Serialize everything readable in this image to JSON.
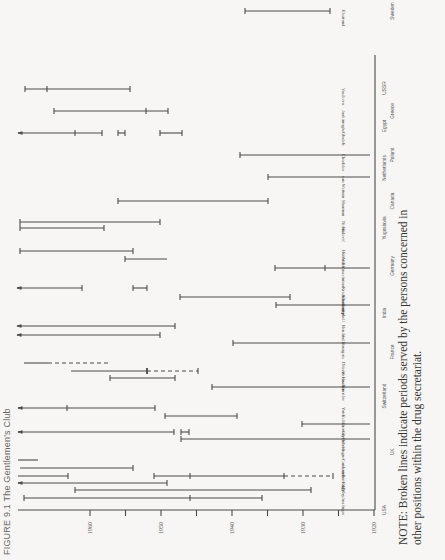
{
  "figure": {
    "title": "FIGURE 9.1   The Gentlemen's Club",
    "note_line1": "NOTE: Broken lines indicate periods served by the persons concerned in",
    "note_line2": "other positions within the drug secretariat."
  },
  "colors": {
    "ink": "#4a4a4a",
    "background": "#f7f6f4"
  },
  "chart_data": {
    "type": "timeline",
    "title": "The Gentlemen's Club",
    "xlabel": "Year",
    "axis_ticks": [
      1920,
      1930,
      1940,
      1950,
      1960
    ],
    "xlim": [
      1920,
      1968
    ],
    "legend_note": "Broken lines indicate periods served by the persons concerned in other positions within the drug secretariat.",
    "countries": [
      "USA",
      "UK",
      "Switzerland",
      "France",
      "India",
      "Germany",
      "Yugoslavia",
      "Canada",
      "Netherlands",
      "Poland",
      "Egypt",
      "Greece",
      "USSR",
      "Sweden"
    ],
    "persons": [
      {
        "name": "Anslinger",
        "country": "USA",
        "segments": [
          [
            1930,
            1962
          ]
        ],
        "marks": [
          1946
        ]
      },
      {
        "name": "May",
        "country": "USA",
        "segments": [
          [
            1927,
            1957
          ]
        ]
      },
      {
        "name": "Eddy",
        "country": "USA",
        "segments": [
          [
            1952,
            1967
          ]
        ]
      },
      {
        "name": "Sniving",
        "country": "USA",
        "segments": [
          [
            1946,
            1958
          ],
          [
            1931,
            1946
          ],
          [
            1920,
            1931,
            "dashed"
          ]
        ],
        "marks": [
          1933,
          1946
        ]
      },
      {
        "name": "Lande",
        "country": "USA",
        "segments": [
          [
            1953,
            1967
          ]
        ]
      },
      {
        "name": "Cameron",
        "country": "USA",
        "segments": [
          [
            1964,
            1967
          ]
        ]
      },
      {
        "name": "Delevingne",
        "country": "UK",
        "segments": [
          [
            1913,
            1946
          ]
        ]
      },
      {
        "name": "Greenfield",
        "country": "UK",
        "segments": [
          [
            1947,
            1948
          ]
        ]
      },
      {
        "name": "Crowdy",
        "country": "UK",
        "segments": [
          [
            1922,
            1931
          ]
        ]
      },
      {
        "name": "Felkin",
        "country": "UK",
        "segments": [
          [
            1937,
            1947
          ]
        ]
      },
      {
        "name": "Yates",
        "country": "UK",
        "segments": [
          [
            1949,
            1966
          ]
        ],
        "marks": [
          1962
        ]
      },
      {
        "name": "Carrière",
        "country": "Switzerland",
        "segments": [
          [
            1928,
            1944
          ]
        ]
      },
      {
        "name": "Fischer",
        "country": "Switzerland",
        "segments": [
          [
            1948,
            1957
          ]
        ]
      },
      {
        "name": "Atzenwiler",
        "country": "Switzerland",
        "segments": [
          [
            1945,
            1956
          ],
          [
            1941,
            1945,
            "dashed"
          ]
        ]
      },
      {
        "name": "Ditzert",
        "country": "Switzerland",
        "segments": [
          [
            1961,
            1965
          ],
          [
            1953,
            1961,
            "dashed"
          ]
        ]
      },
      {
        "name": "Bourgois",
        "country": "France",
        "segments": [
          [
            1920,
            1938
          ]
        ]
      },
      {
        "name": "Vaille",
        "country": "France",
        "segments": [
          [
            1947,
            1968
          ]
        ]
      },
      {
        "name": "Renier",
        "country": "France",
        "segments": [
          [
            1945,
            1968
          ]
        ]
      },
      {
        "name": "Campbell",
        "country": "India",
        "segments": [
          [
            1920,
            1935
          ]
        ]
      },
      {
        "name": "Chatterjee",
        "country": "India",
        "segments": [
          [
            1935,
            1949
          ]
        ]
      },
      {
        "name": "Krishnamoorty",
        "country": "India",
        "segments": [
          [
            1952,
            1954
          ]
        ]
      },
      {
        "name": "Anselmino",
        "country": "Germany",
        "segments": [
          [
            1920,
            1935
          ]
        ],
        "marks": [
          1928
        ]
      },
      {
        "name": "Wolff",
        "country": "Germany",
        "segments": [
          [
            1951,
            1955
          ]
        ]
      },
      {
        "name": "Hüttisch",
        "country": "Germany",
        "segments": [
          [
            1952,
            1968
          ]
        ]
      },
      {
        "name": "Nicolić",
        "country": "Yugoslavia",
        "segments": [
          [
            1953,
            1967
          ],
          [
            1953,
            1967
          ]
        ]
      },
      {
        "name": "Kušević",
        "country": "Yugoslavia",
        "segments": [
          [
            1949,
            1951
          ],
          [
            1956,
            1967
          ]
        ]
      },
      {
        "name": "Sharman",
        "country": "Canada",
        "segments": [
          [
            1925,
            1946
          ]
        ]
      },
      {
        "name": "van Wettum",
        "country": "Netherlands",
        "segments": [
          [
            1920,
            1933
          ]
        ]
      },
      {
        "name": "Chodzko",
        "country": "Poland",
        "segments": [
          [
            1920,
            1937
          ]
        ]
      },
      {
        "name": "Ghaleb",
        "country": "Egypt",
        "segments": [
          [
            1948,
            1951
          ],
          [
            1954,
            1955
          ],
          [
            1958,
            1962
          ],
          [
            1962,
            1968
          ]
        ]
      },
      {
        "name": "Joakimoglu",
        "country": "Greece",
        "segments": [
          [
            1948,
            1957
          ]
        ]
      },
      {
        "name": "Vasilieva",
        "country": "USSR",
        "segments": [
          [
            1955,
            1965
          ]
        ],
        "marks": [
          1963
        ]
      },
      {
        "name": "Ekstrand",
        "country": "Sweden",
        "segments": [
          [
            1931,
            1937
          ]
        ]
      }
    ]
  },
  "axis": {
    "ticks": [
      "1960",
      "1950",
      "1940",
      "1930",
      "1920"
    ]
  },
  "labels": {
    "countries": [
      "USA",
      "UK",
      "Switzerland",
      "France",
      "India",
      "Germany",
      "Yugoslavia",
      "Canada",
      "Netherlands",
      "Poland",
      "Egypt",
      "Greece",
      "USSR",
      "Sweden"
    ],
    "persons": [
      "Anslinger",
      "May",
      "Eddy",
      "Sniving",
      "Lande",
      "Cameron",
      "Delevingne",
      "Greenfield",
      "Crowdy",
      "Felkin",
      "Yates",
      "Carrière",
      "Fischer",
      "Atzenwiler",
      "Ditzert",
      "Bourgois",
      "Vaille",
      "Renier",
      "Campbell",
      "Chatterjee",
      "Krishnamoorty",
      "Anselmino",
      "Wolff",
      "Hüttisch",
      "Nicolić",
      "Kušević",
      "Sharman",
      "van Wettum",
      "Chodzko",
      "Ghaleb",
      "Joakimoglu",
      "Vasilieva",
      "Ekstrand"
    ]
  }
}
